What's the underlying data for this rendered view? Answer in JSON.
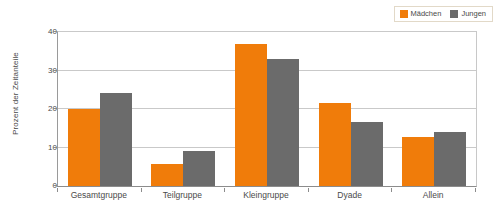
{
  "chart_data": {
    "type": "bar",
    "title": "",
    "xlabel": "",
    "ylabel": "Prozent der Zeitanteile",
    "ylim": [
      0,
      40
    ],
    "yticks": [
      0,
      10,
      20,
      30,
      40
    ],
    "grid": true,
    "legend_position": "top-right",
    "categories": [
      "Gesamtgruppe",
      "Teilgruppe",
      "Kleingruppe",
      "Dyade",
      "Allein"
    ],
    "series": [
      {
        "name": "Mädchen",
        "color": "#F07C0A",
        "values": [
          20.0,
          5.6,
          37.0,
          21.6,
          12.7
        ]
      },
      {
        "name": "Jungen",
        "color": "#6B6B6B",
        "values": [
          24.2,
          9.2,
          33.0,
          16.7,
          14.1
        ]
      }
    ]
  },
  "legend": {
    "entries": [
      {
        "label": "Mädchen",
        "color": "#F07C0A"
      },
      {
        "label": "Jungen",
        "color": "#6B6B6B"
      }
    ]
  },
  "axes": {
    "y_title": "Prozent der Zeitanteile",
    "y_tick_labels": [
      "40",
      "30",
      "20",
      "10",
      "0"
    ],
    "x_tick_labels": [
      "Gesamtgruppe",
      "Teilgruppe",
      "Kleingruppe",
      "Dyade",
      "Allein"
    ]
  }
}
